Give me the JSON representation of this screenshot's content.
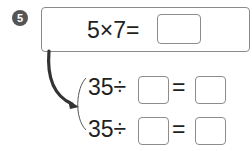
{
  "problem": {
    "number": "5",
    "main_equation": {
      "expression": "5×7=",
      "answer": ""
    },
    "derived_equations": [
      {
        "dividend": "35",
        "operator": "÷",
        "equals": "=",
        "divisor": "",
        "quotient": ""
      },
      {
        "dividend": "35",
        "operator": "÷",
        "equals": "=",
        "divisor": "",
        "quotient": ""
      }
    ]
  },
  "colors": {
    "badge": "#555555",
    "box_border": "#8a8a8a",
    "text": "#231f20",
    "arrow": "#333333"
  }
}
